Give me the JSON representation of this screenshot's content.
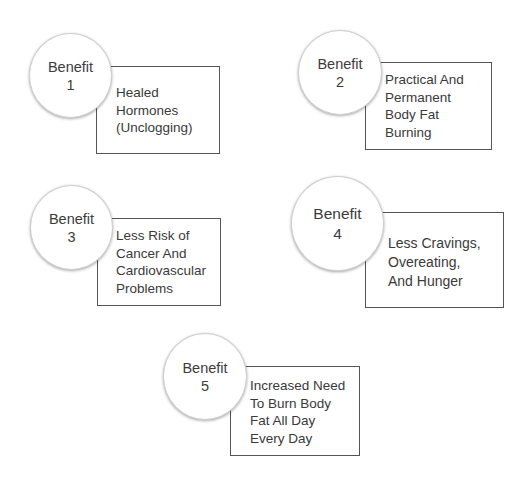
{
  "benefits": [
    {
      "label": "Benefit",
      "number": "1",
      "lines": [
        "Healed",
        "Hormones",
        "(Unclogging)"
      ]
    },
    {
      "label": "Benefit",
      "number": "2",
      "lines": [
        "Practical And",
        "Permanent",
        "Body Fat",
        "Burning"
      ]
    },
    {
      "label": "Benefit",
      "number": "3",
      "lines": [
        "Less Risk of",
        "Cancer And",
        "Cardiovascular",
        "Problems"
      ]
    },
    {
      "label": "Benefit",
      "number": "4",
      "lines": [
        "Less Cravings,",
        "Overeating,",
        "And Hunger"
      ]
    },
    {
      "label": "Benefit",
      "number": "5",
      "lines": [
        "Increased Need",
        "To Burn Body",
        "Fat All Day",
        "Every Day"
      ]
    }
  ],
  "colors": {
    "border": "#555555",
    "text": "#3a3a3a",
    "background": "#ffffff"
  }
}
